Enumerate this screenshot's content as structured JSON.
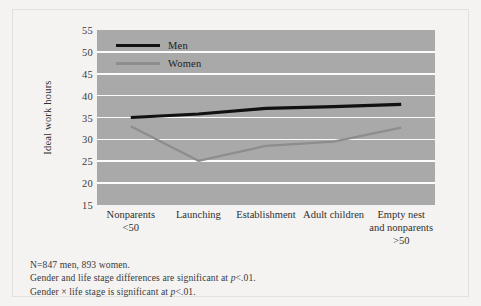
{
  "figure": {
    "background_color": "#f4f3f2",
    "plot_background_color": "#a9a9a9",
    "gridline_color": "#fbfbfb"
  },
  "legend": {
    "position": "inside-top-left",
    "items": [
      {
        "label": "Men",
        "color": "#111111"
      },
      {
        "label": "Women",
        "color": "#8d8d8d"
      }
    ]
  },
  "notes": [
    "N=847 men, 893 women.",
    "Gender and life stage differences are significant at p<.01.",
    "Gender × life stage is significant at p<.01."
  ],
  "notes_parts": {
    "line1": "N=847 men, 893 women.",
    "line2_pre": "Gender and life stage differences are significant at ",
    "line2_ital": "p",
    "line2_post": "<.01.",
    "line3_pre": "Gender × life stage is significant at ",
    "line3_ital": "p",
    "line3_post": "<.01."
  },
  "chart_data": {
    "type": "line",
    "title": "",
    "xlabel": "",
    "ylabel": "Ideal work hours",
    "ylim": [
      15,
      55
    ],
    "yticks": [
      55,
      50,
      45,
      40,
      35,
      30,
      25,
      20,
      15
    ],
    "grid": true,
    "legend_position": "upper left",
    "categories": [
      "Nonparents\n<50",
      "Launching",
      "Establishment",
      "Adult children",
      "Empty nest\nand nonparents\n>50"
    ],
    "category_lines": [
      [
        "Nonparents",
        "<50"
      ],
      [
        "Launching"
      ],
      [
        "Establishment"
      ],
      [
        "Adult children"
      ],
      [
        "Empty nest",
        "and nonparents",
        ">50"
      ]
    ],
    "series": [
      {
        "name": "Men",
        "color": "#111111",
        "width": 3.2,
        "values": [
          35.0,
          35.8,
          37.1,
          37.5,
          38.0
        ]
      },
      {
        "name": "Women",
        "color": "#8d8d8d",
        "width": 2.2,
        "values": [
          33.0,
          25.1,
          28.5,
          29.5,
          32.7
        ]
      }
    ]
  }
}
